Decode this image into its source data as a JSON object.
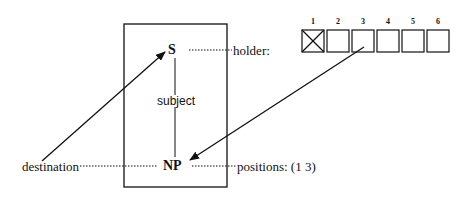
{
  "diagram": {
    "node_top": "S",
    "node_bottom": "NP",
    "edge_label": "subject",
    "left_label": "destination",
    "right_top_label": "holder:",
    "right_bottom_label": "positions: (1 3)",
    "slot_numbers": [
      "1",
      "2",
      "3",
      "4",
      "5",
      "6"
    ],
    "filled_slot": "1"
  }
}
